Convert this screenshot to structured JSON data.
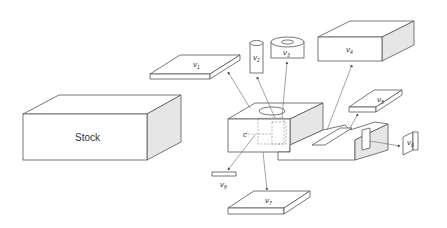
{
  "diagram": {
    "stock_label": "Stock",
    "feature_label": "c",
    "volumes": [
      {
        "id": "v1",
        "base": "v",
        "sub": "1"
      },
      {
        "id": "v2",
        "base": "v",
        "sub": "2"
      },
      {
        "id": "v3",
        "base": "v",
        "sub": "3"
      },
      {
        "id": "v4",
        "base": "v",
        "sub": "4"
      },
      {
        "id": "v5",
        "base": "v",
        "sub": "5"
      },
      {
        "id": "v6",
        "base": "v",
        "sub": "6"
      },
      {
        "id": "v7",
        "base": "v",
        "sub": "7"
      },
      {
        "id": "v8",
        "base": "v",
        "sub": "8"
      }
    ]
  }
}
